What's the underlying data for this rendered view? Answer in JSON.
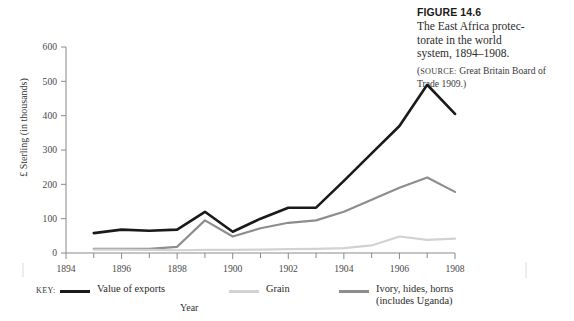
{
  "caption": {
    "figure_number": "FIGURE 14.6",
    "title": "The East Africa protec-\ntorate in the world\nsystem, 1894–1908.",
    "source_label": "SOURCE:",
    "source_text": " Great Britain Board of Trade 1909.)",
    "source_open_paren": "("
  },
  "legend": {
    "key_label": "KEY:",
    "items": [
      {
        "label": "Value of exports",
        "color": "#1a1a1a",
        "width": 2.6
      },
      {
        "label": "Grain",
        "color": "#d2d2d2",
        "width": 2.2
      },
      {
        "label": "Ivory, hides, horns\n(includes Uganda)",
        "color": "#8d8d8d",
        "width": 2.2
      }
    ]
  },
  "chart_data": {
    "type": "line",
    "xlabel": "Year",
    "ylabel": "£ Sterling (in thousands)",
    "xlim": [
      1894,
      1908
    ],
    "ylim": [
      0,
      600
    ],
    "xticks": [
      1894,
      1896,
      1898,
      1900,
      1902,
      1904,
      1906,
      1908
    ],
    "xticklabels": [
      "1894",
      "1896",
      "1898",
      "1900",
      "1902",
      "1904",
      "1906",
      "1908"
    ],
    "yticks": [
      0,
      100,
      200,
      300,
      400,
      500,
      600
    ],
    "yticklabels": [
      "0",
      "100",
      "200",
      "300",
      "400",
      "500",
      "600"
    ],
    "grid": false,
    "legend_position": "below-axis",
    "x": [
      1895,
      1896,
      1897,
      1898,
      1899,
      1900,
      1901,
      1902,
      1903,
      1904,
      1905,
      1906,
      1907,
      1908
    ],
    "series": [
      {
        "name": "Value of exports",
        "color": "#1a1a1a",
        "width": 2.6,
        "values": [
          58,
          68,
          65,
          68,
          120,
          62,
          100,
          132,
          132,
          210,
          290,
          370,
          490,
          405
        ]
      },
      {
        "name": "Ivory, hides, horns (includes Uganda)",
        "color": "#8d8d8d",
        "width": 2.2,
        "values": [
          12,
          12,
          12,
          18,
          95,
          48,
          72,
          88,
          95,
          120,
          155,
          190,
          220,
          178
        ]
      },
      {
        "name": "Grain",
        "color": "#d2d2d2",
        "width": 2.2,
        "values": [
          10,
          10,
          9,
          8,
          9,
          9,
          10,
          11,
          12,
          14,
          22,
          48,
          38,
          42
        ]
      }
    ]
  }
}
